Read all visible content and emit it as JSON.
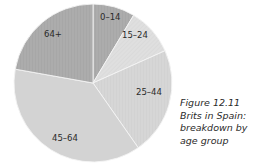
{
  "chart_data": {
    "type": "pie",
    "title": "Figure 12.11 Brits in Spain: breakdown by age group",
    "categories": [
      "0–14",
      "15–24",
      "25–44",
      "45–64",
      "64+"
    ],
    "values": [
      8.6,
      9.7,
      22.0,
      37.5,
      22.2
    ],
    "unit": "approx. % share (estimated from slice angles)",
    "start_angle_deg": 0,
    "direction": "clockwise",
    "colors": [
      "#a9a9a9",
      "#d9d9d9",
      "#cfcfcf",
      "#d4d4d4",
      "#a2a2a2"
    ],
    "legend": "none (labels inside slices)"
  },
  "caption": {
    "line1": "Figure 12.11",
    "line2": "Brits in Spain:",
    "line3": "breakdown by",
    "line4": "age group"
  },
  "labels": {
    "s0": "0–14",
    "s1": "15–24",
    "s2": "25–44",
    "s3": "45–64",
    "s4": "64+"
  }
}
